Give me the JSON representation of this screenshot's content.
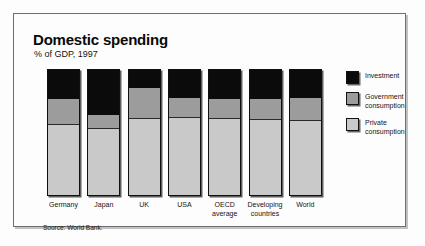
{
  "header": {
    "title": "Domestic spending",
    "subtitle": "% of GDP, 1997"
  },
  "source_note": "Source: World Bank.",
  "legend": {
    "items": [
      {
        "label": "Investment",
        "color": "#0b0b0b",
        "swatch_name": "investment-swatch"
      },
      {
        "label": "Government consumption",
        "color": "#9c9c9c",
        "swatch_name": "government-consumption-swatch"
      },
      {
        "label": "Private consumption",
        "color": "#c9c9c9",
        "swatch_name": "private-consumption-swatch"
      }
    ]
  },
  "chart_data": {
    "type": "bar",
    "subtype": "stacked-vertical-100",
    "title": "Domestic spending",
    "subtitle": "% of GDP, 1997",
    "xlabel": "",
    "ylabel": "% of GDP",
    "ylim": [
      0,
      100
    ],
    "grid": false,
    "axis_ticks_visible": false,
    "legend_position": "right",
    "source": "Source: World Bank.",
    "categories": [
      "Germany",
      "Japan",
      "UK",
      "USA",
      "OECD average",
      "Developing countries",
      "World"
    ],
    "series": [
      {
        "name": "Private consumption",
        "color": "#c9c9c9",
        "values": [
          56,
          53,
          61,
          62,
          61,
          60,
          59
        ]
      },
      {
        "name": "Government consumption",
        "color": "#9c9c9c",
        "values": [
          21,
          11,
          25,
          16,
          16,
          17,
          19
        ]
      },
      {
        "name": "Investment",
        "color": "#0b0b0b",
        "values": [
          23,
          36,
          14,
          22,
          23,
          23,
          22
        ]
      }
    ],
    "stack_order_bottom_to_top": [
      "Private consumption",
      "Government consumption",
      "Investment"
    ],
    "bars": [
      {
        "category": "Germany",
        "private_consumption": 56,
        "government_consumption": 21,
        "investment": 23
      },
      {
        "category": "Japan",
        "private_consumption": 53,
        "government_consumption": 11,
        "investment": 36
      },
      {
        "category": "UK",
        "private_consumption": 61,
        "government_consumption": 25,
        "investment": 14
      },
      {
        "category": "USA",
        "private_consumption": 62,
        "government_consumption": 16,
        "investment": 22
      },
      {
        "category": "OECD average",
        "private_consumption": 61,
        "government_consumption": 16,
        "investment": 23
      },
      {
        "category": "Developing countries",
        "private_consumption": 60,
        "government_consumption": 17,
        "investment": 23
      },
      {
        "category": "World",
        "private_consumption": 59,
        "government_consumption": 19,
        "investment": 22
      }
    ]
  }
}
